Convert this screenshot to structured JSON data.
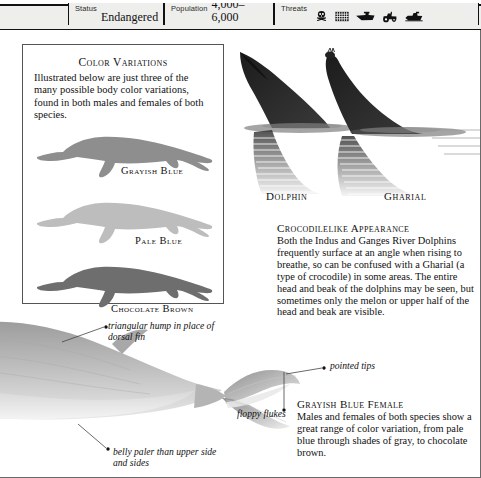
{
  "factbar": {
    "status": {
      "label": "Status",
      "value": "Endangered"
    },
    "population": {
      "label": "Population",
      "value": "4,000–6,000"
    },
    "threats": {
      "label": "Threats",
      "icons": [
        "poison-skull-icon",
        "fishing-net-icon",
        "hunting-boat-icon",
        "tractor-icon",
        "motorboat-icon"
      ]
    }
  },
  "color_variations": {
    "title": "Color Variations",
    "intro": "Illustrated below are just three of the many possible body color variations, found in both males and females of both species.",
    "swatches": [
      {
        "label": "Grayish Blue",
        "color": "#8e8e8e"
      },
      {
        "label": "Pale Blue",
        "color": "#bdbdbd"
      },
      {
        "label": "Chocolate Brown",
        "color": "#6e6e6e"
      }
    ]
  },
  "photo": {
    "dolphin_caption": "Dolphin",
    "gharial_caption": "Gharial"
  },
  "croc_block": {
    "heading": "Crocodilelike Appearance",
    "body": "Both the Indus and Ganges River Dolphins frequently surface at an angle when rising to breathe, so can be confused with a Gharial (a type of crocodile) in some areas. The entire head and beak of the dolphins may be seen, but sometimes only the melon or upper half of the head and beak are visible."
  },
  "annotations": {
    "hump": "triangular hump in place of dorsal fin",
    "tips": "pointed tips",
    "flukes": "floppy flukes",
    "belly": "belly paler than upper side and sides"
  },
  "female_block": {
    "heading": "Grayish Blue Female",
    "body": "Males and females of both species show a great range of color variation, from pale blue through shades of gray, to chocolate brown."
  }
}
